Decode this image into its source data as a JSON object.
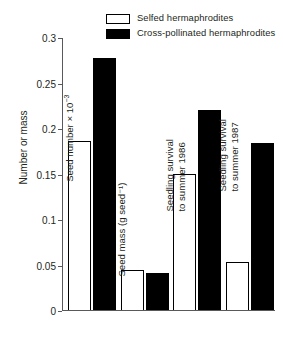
{
  "chart_data": {
    "type": "bar",
    "title": "",
    "xlabel": "",
    "ylabel": "Number or mass",
    "ylim": [
      0,
      0.3
    ],
    "yticks": [
      "0",
      "0.05",
      "0.1",
      "0.15",
      "0.2",
      "0.25",
      "0.3"
    ],
    "ytick_values": [
      0,
      0.05,
      0.1,
      0.15,
      0.2,
      0.25,
      0.3
    ],
    "grid": false,
    "legend_position": "top-right",
    "categories": [
      "Seed number × 10⁻³",
      "Seed mass (g seed⁻¹)",
      "Seedling survival to summer 1986",
      "Seedling survival to summer 1987"
    ],
    "series": [
      {
        "name": "Selfed hermaphrodites",
        "color": "#ffffff",
        "edgecolor": "#000000",
        "values": [
          0.186,
          0.044,
          0.149,
          0.053
        ]
      },
      {
        "name": "Cross-pollinated hermaphrodites",
        "color": "#000000",
        "edgecolor": "#000000",
        "values": [
          0.277,
          0.041,
          0.22,
          0.184
        ]
      }
    ]
  },
  "legend": {
    "items": [
      {
        "label": "Selfed hermaphrodites",
        "swatch": "open-rectangle-swatch"
      },
      {
        "label": "Cross-pollinated hermaphrodites",
        "swatch": "filled-rectangle-swatch"
      }
    ]
  },
  "axis": {
    "y_label": "Number or mass",
    "y_ticks": [
      "0.3",
      "0.25",
      "0.2",
      "0.15",
      "0.1",
      "0.05",
      "0"
    ]
  },
  "group_labels": {
    "g1_line1": "Seed number × 10",
    "g1_sup": "−3",
    "g2": "Seed mass (g seed⁻¹)",
    "g3_line1": "Seedling survival",
    "g3_line2": "to summer 1986",
    "g4_line1": "Seedling survival",
    "g4_line2": "to summer 1987"
  }
}
